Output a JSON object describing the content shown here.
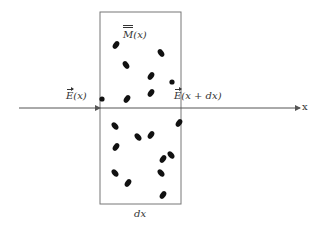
{
  "diagram": {
    "labels": {
      "field_in_symbol": "E",
      "field_in_arg": "(x)",
      "field_out_symbol": "E",
      "field_out_arg": "(x + dx)",
      "medium_symbol": "M",
      "medium_arg": "(x)",
      "thickness": "dx",
      "axis": "x"
    },
    "colors": {
      "line": "#555555",
      "particle": "#111111",
      "text": "#333333"
    },
    "slab": {
      "x": 100,
      "y": 12,
      "width": 81,
      "height": 192
    },
    "axis": {
      "y": 108,
      "x_start": 19,
      "x_end": 300
    },
    "particles": [
      {
        "cx": 116,
        "cy": 45,
        "rot": -55
      },
      {
        "cx": 161,
        "cy": 53,
        "rot": 55
      },
      {
        "cx": 126,
        "cy": 65,
        "rot": 55
      },
      {
        "cx": 151,
        "cy": 76,
        "rot": -55
      },
      {
        "cx": 172,
        "cy": 82,
        "rot": 0,
        "round": true
      },
      {
        "cx": 151,
        "cy": 93,
        "rot": -55
      },
      {
        "cx": 127,
        "cy": 99,
        "rot": -55
      },
      {
        "cx": 102,
        "cy": 99,
        "rot": 0,
        "round": true
      },
      {
        "cx": 115,
        "cy": 126,
        "rot": 50
      },
      {
        "cx": 179,
        "cy": 123,
        "rot": -55
      },
      {
        "cx": 138,
        "cy": 137,
        "rot": 50
      },
      {
        "cx": 151,
        "cy": 135,
        "rot": -55
      },
      {
        "cx": 116,
        "cy": 147,
        "rot": -55
      },
      {
        "cx": 171,
        "cy": 155,
        "rot": 50
      },
      {
        "cx": 163,
        "cy": 159,
        "rot": -55
      },
      {
        "cx": 115,
        "cy": 173,
        "rot": 50
      },
      {
        "cx": 161,
        "cy": 173,
        "rot": 50
      },
      {
        "cx": 128,
        "cy": 183,
        "rot": -55
      },
      {
        "cx": 163,
        "cy": 195,
        "rot": -55
      }
    ]
  }
}
